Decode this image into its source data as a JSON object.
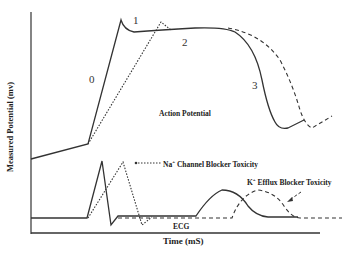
{
  "diagram": {
    "axes": {
      "y_label": "Measured Potential (mv)",
      "x_label": "Time (mS)"
    },
    "phase_labels": [
      "0",
      "1",
      "2",
      "3"
    ],
    "annotations": {
      "action_potential": "Action Potential",
      "ecg": "ECG",
      "na_blocker_prefix": "Na",
      "na_blocker_sup": "+",
      "na_blocker_suffix": " Channel Blocker Toxicity",
      "k_blocker_prefix": "K",
      "k_blocker_sup": "+",
      "k_blocker_suffix": " Efflux Blocker  Toxicity"
    },
    "legend": [
      {
        "name": "normal",
        "style": "solid"
      },
      {
        "name": "Na+ Channel Blocker Toxicity",
        "style": "dotted"
      },
      {
        "name": "K+ Efflux Blocker Toxicity",
        "style": "dashed"
      }
    ],
    "colors": {
      "line": "#333333",
      "text": "#222222",
      "background": "#ffffff"
    }
  }
}
